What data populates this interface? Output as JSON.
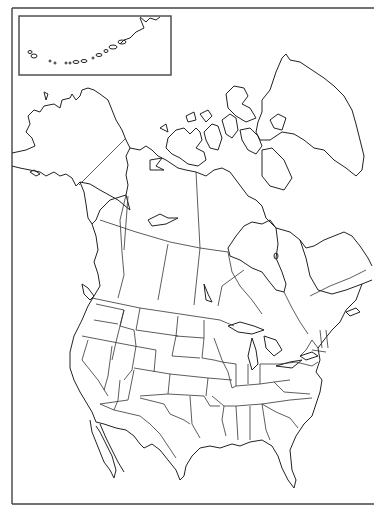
{
  "map": {
    "type": "blank-outline-map",
    "region": "North America",
    "labels": [],
    "inset": {
      "region": "Aleutian Islands",
      "labels": []
    },
    "colors": {
      "background": "#ffffff",
      "outline": "#222222"
    }
  }
}
